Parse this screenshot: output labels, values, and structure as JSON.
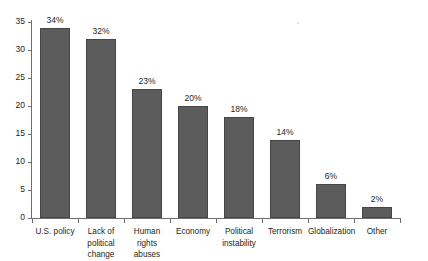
{
  "chart_data": {
    "type": "bar",
    "title": "",
    "subtitle": "",
    "xlabel": "",
    "ylabel": "",
    "ylim": [
      0,
      35
    ],
    "ytick_step": 5,
    "grid": false,
    "legend": null,
    "orientation": "vertical",
    "bar_color": "#5c5c5c",
    "bar_border_color": "#464646",
    "axis_color": "#6d6e70",
    "text_color": "#231f20",
    "background": "#ffffff",
    "categories": [
      "U.S. policy",
      "Lack of political change",
      "Human rights abuses",
      "Economy",
      "Political instability",
      "Terrorism",
      "Globalization",
      "Other"
    ],
    "category_label_lines": [
      [
        "U.S. policy"
      ],
      [
        "Lack of",
        "political",
        "change"
      ],
      [
        "Human",
        "rights",
        "abuses"
      ],
      [
        "Economy"
      ],
      [
        "Political",
        "instability"
      ],
      [
        "Terrorism"
      ],
      [
        "Globalization"
      ],
      [
        "Other"
      ]
    ],
    "values": [
      34,
      32,
      23,
      20,
      18,
      14,
      6,
      2
    ],
    "data_labels": [
      "34%",
      "32%",
      "23%",
      "20%",
      "18%",
      "14%",
      "6%",
      "2%"
    ],
    "ytick_labels": [
      "0",
      "5",
      "10",
      "15",
      "20",
      "25",
      "30",
      "35"
    ],
    "ytick_values": [
      0,
      5,
      10,
      15,
      20,
      25,
      30,
      35
    ]
  }
}
